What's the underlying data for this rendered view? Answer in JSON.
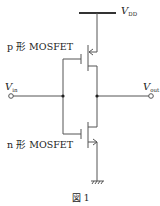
{
  "labels": {
    "vdd_main": "V",
    "vdd_sub": "DD",
    "vin_main": "V",
    "vin_sub": "in",
    "vout_main": "V",
    "vout_sub": "out",
    "pmos": "p 形 MOSFET",
    "nmos": "n 形 MOSFET"
  },
  "caption": "図 1",
  "colors": {
    "line": "#555555",
    "vdd_bar": "#333333",
    "text": "#222222"
  }
}
